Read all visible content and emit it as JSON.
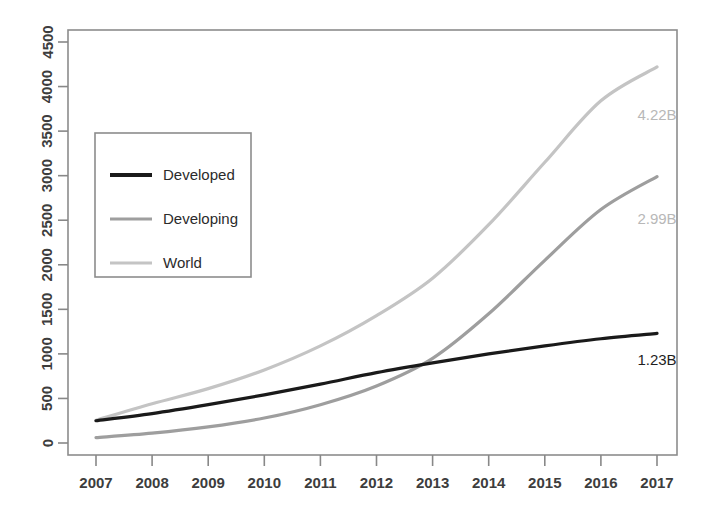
{
  "chart_data": {
    "type": "line",
    "title": "",
    "subtitle": "",
    "xlabel": "",
    "ylabel": "",
    "x": [
      2007,
      2008,
      2009,
      2010,
      2011,
      2012,
      2013,
      2014,
      2015,
      2016,
      2017
    ],
    "categories": [
      "2007",
      "2008",
      "2009",
      "2010",
      "2011",
      "2012",
      "2013",
      "2014",
      "2015",
      "2016",
      "2017"
    ],
    "xlim": [
      2007,
      2017
    ],
    "ylim": [
      0,
      4500
    ],
    "ytick_values": [
      0,
      500,
      1000,
      1500,
      2000,
      2500,
      3000,
      3500,
      4000,
      4500
    ],
    "ytick_labels": [
      "0",
      "500",
      "1000",
      "1500",
      "2000",
      "2500",
      "3000",
      "3500",
      "4000",
      "4500"
    ],
    "xtick_labels": [
      "2007",
      "2008",
      "2009",
      "2010",
      "2011",
      "2012",
      "2013",
      "2014",
      "2015",
      "2016",
      "2017"
    ],
    "grid": false,
    "legend_position": "upper-left",
    "series": [
      {
        "name": "Developed",
        "color": "#1a1a1a",
        "linewidth": 3.2,
        "values": [
          250,
          330,
          430,
          540,
          660,
          790,
          900,
          1000,
          1090,
          1170,
          1230
        ]
      },
      {
        "name": "Developing",
        "color": "#9e9e9e",
        "linewidth": 3.2,
        "values": [
          60,
          110,
          180,
          280,
          430,
          640,
          950,
          1450,
          2050,
          2620,
          2990
        ]
      },
      {
        "name": "World",
        "color": "#c4c4c4",
        "linewidth": 3.2,
        "values": [
          255,
          440,
          610,
          820,
          1090,
          1430,
          1850,
          2450,
          3150,
          3840,
          4220
        ]
      }
    ],
    "annotations": [
      {
        "text": "4.22B",
        "series": "World",
        "x": 2017,
        "y": 3620,
        "color": "#b8b8b8"
      },
      {
        "text": "2.99B",
        "series": "Developing",
        "x": 2017,
        "y": 2460,
        "color": "#b8b8b8"
      },
      {
        "text": "1.23B",
        "series": "Developed",
        "x": 2017,
        "y": 870,
        "color": "#1f1f1f"
      }
    ]
  },
  "legend": {
    "items": [
      {
        "label": "Developed",
        "color": "#1a1a1a"
      },
      {
        "label": "Developing",
        "color": "#9e9e9e"
      },
      {
        "label": "World",
        "color": "#c4c4c4"
      }
    ]
  },
  "axes": {
    "frame_color": "#888888",
    "tick_color": "#888888",
    "label_color": "#3d3d3d"
  }
}
